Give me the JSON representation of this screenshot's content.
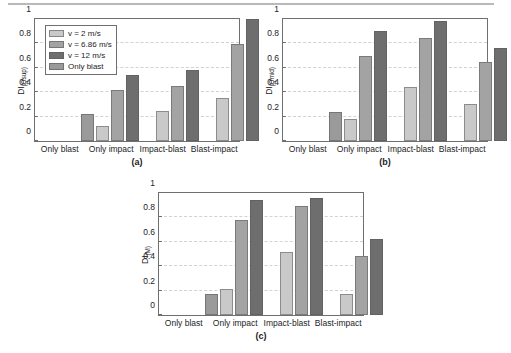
{
  "figure": {
    "categories": [
      "Only blast",
      "Only impact",
      "Impact-blast",
      "Blast-impact"
    ],
    "series_names": [
      "v = 2 m/s",
      "v = 6.86 m/s",
      "v = 12 m/s",
      "Only blast"
    ],
    "yticks": [
      "0",
      "0.2",
      "0.4",
      "0.6",
      "0.8",
      "1"
    ],
    "colors": {
      "light": "#c9c9c9",
      "medium": "#a3a3a3",
      "dark": "#6e6e6e",
      "onlyblast": "#9a9a9a",
      "axis": "#6f6f6f",
      "grid": "#d2d2d2"
    },
    "legend": {
      "v2_label": "v = 2 m/s",
      "v686_label": "v = 6.86 m/s",
      "v12_label": "v = 12 m/s",
      "onlyblast_label": "Only blast"
    },
    "panels": [
      {
        "caption": "(a)",
        "ylabel_main": "DI",
        "ylabel_sub": "(Qsup)"
      },
      {
        "caption": "(b)",
        "ylabel_main": "DI",
        "ylabel_sub": "(Qmid)"
      },
      {
        "caption": "(c)",
        "ylabel_main": "DI",
        "ylabel_sub": "(M)"
      }
    ]
  },
  "chart_data": [
    {
      "type": "bar",
      "title": "(a)",
      "xlabel": "",
      "ylabel": "DI(Qsup)",
      "ylim": [
        0,
        1
      ],
      "yticks": [
        0,
        0.2,
        0.4,
        0.6,
        0.8,
        1
      ],
      "grid": true,
      "legend_position": "upper-left",
      "categories": [
        "Only blast",
        "Only impact",
        "Impact-blast",
        "Blast-impact"
      ],
      "series": [
        {
          "name": "v = 2 m/s",
          "values": [
            null,
            0.12,
            0.245,
            0.355
          ]
        },
        {
          "name": "v = 6.86 m/s",
          "values": [
            null,
            0.42,
            0.455,
            0.795
          ]
        },
        {
          "name": "v = 12 m/s",
          "values": [
            null,
            0.545,
            0.585,
            1.0
          ]
        },
        {
          "name": "Only blast",
          "values": [
            0.225,
            null,
            null,
            null
          ]
        }
      ]
    },
    {
      "type": "bar",
      "title": "(b)",
      "xlabel": "",
      "ylabel": "DI(Qmid)",
      "ylim": [
        0,
        1
      ],
      "yticks": [
        0,
        0.2,
        0.4,
        0.6,
        0.8,
        1
      ],
      "grid": true,
      "legend_position": "none",
      "categories": [
        "Only blast",
        "Only impact",
        "Impact-blast",
        "Blast-impact"
      ],
      "series": [
        {
          "name": "v = 2 m/s",
          "values": [
            null,
            0.18,
            0.44,
            0.3
          ]
        },
        {
          "name": "v = 6.86 m/s",
          "values": [
            null,
            0.7,
            0.845,
            0.65
          ]
        },
        {
          "name": "v = 12 m/s",
          "values": [
            null,
            0.9,
            0.98,
            0.76
          ]
        },
        {
          "name": "Only blast",
          "values": [
            0.235,
            null,
            null,
            null
          ]
        }
      ]
    },
    {
      "type": "bar",
      "title": "(c)",
      "xlabel": "",
      "ylabel": "DI(M)",
      "ylim": [
        0,
        1
      ],
      "yticks": [
        0,
        0.2,
        0.4,
        0.6,
        0.8,
        1
      ],
      "grid": true,
      "legend_position": "none",
      "categories": [
        "Only blast",
        "Only impact",
        "Impact-blast",
        "Blast-impact"
      ],
      "series": [
        {
          "name": "v = 2 m/s",
          "values": [
            null,
            0.21,
            0.52,
            0.17
          ]
        },
        {
          "name": "v = 6.86 m/s",
          "values": [
            null,
            0.775,
            0.89,
            0.48
          ]
        },
        {
          "name": "v = 12 m/s",
          "values": [
            null,
            0.94,
            0.96,
            0.62
          ]
        },
        {
          "name": "Only blast",
          "values": [
            0.17,
            null,
            null,
            null
          ]
        }
      ]
    }
  ]
}
